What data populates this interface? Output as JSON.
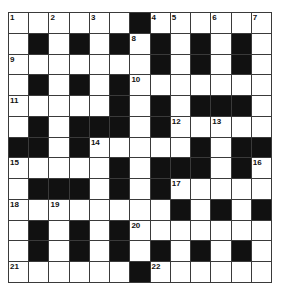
{
  "puzzle": {
    "rows": 13,
    "cols": 13,
    "colors": {
      "black": "#111111",
      "white": "#ffffff",
      "line": "#3a3a3a"
    },
    "grid": [
      "......#......",
      ".#.#.#.#.#.#.",
      ".......#.#.#.",
      ".#.#.#.......",
      ".....#.#.###.",
      ".#.###.#.....",
      "##.#.....#.##",
      ".....#.###.#.",
      ".###.#.#.....",
      "........#.#.#",
      ".#.#.#.......",
      ".#.#.#.#.#.#.",
      "......#......"
    ],
    "numbers": [
      {
        "r": 0,
        "c": 0,
        "n": "1"
      },
      {
        "r": 0,
        "c": 2,
        "n": "2"
      },
      {
        "r": 0,
        "c": 4,
        "n": "3"
      },
      {
        "r": 0,
        "c": 7,
        "n": "4"
      },
      {
        "r": 0,
        "c": 8,
        "n": "5"
      },
      {
        "r": 0,
        "c": 10,
        "n": "6"
      },
      {
        "r": 0,
        "c": 12,
        "n": "7"
      },
      {
        "r": 1,
        "c": 6,
        "n": "8"
      },
      {
        "r": 2,
        "c": 0,
        "n": "9"
      },
      {
        "r": 3,
        "c": 6,
        "n": "10"
      },
      {
        "r": 4,
        "c": 0,
        "n": "11"
      },
      {
        "r": 5,
        "c": 8,
        "n": "12"
      },
      {
        "r": 5,
        "c": 10,
        "n": "13"
      },
      {
        "r": 6,
        "c": 4,
        "n": "14"
      },
      {
        "r": 7,
        "c": 0,
        "n": "15"
      },
      {
        "r": 7,
        "c": 12,
        "n": "16"
      },
      {
        "r": 8,
        "c": 8,
        "n": "17"
      },
      {
        "r": 9,
        "c": 0,
        "n": "18"
      },
      {
        "r": 9,
        "c": 2,
        "n": "19"
      },
      {
        "r": 10,
        "c": 6,
        "n": "20"
      },
      {
        "r": 12,
        "c": 0,
        "n": "21"
      },
      {
        "r": 12,
        "c": 7,
        "n": "22"
      }
    ]
  }
}
